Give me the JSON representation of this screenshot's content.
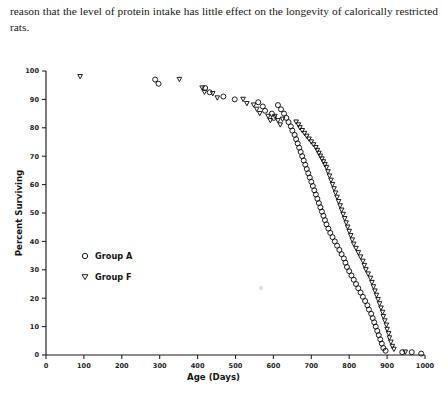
{
  "page": {
    "body_text": "reason that the level of protein intake has little effect on the longevity of calorically restricted rats."
  },
  "figure": {
    "legend": [
      {
        "marker": "circle-open",
        "label": "Group A",
        "marker_icon_name": "open-circle-marker-icon"
      },
      {
        "marker": "triangle-down-open",
        "label": "Group F",
        "marker_icon_name": "open-triangle-down-marker-icon"
      }
    ]
  },
  "chart_data": {
    "type": "scatter",
    "title": "",
    "xlabel": "Age (Days)",
    "ylabel": "Percent Surviving",
    "xlim": [
      0,
      1000
    ],
    "ylim": [
      0,
      100
    ],
    "xticks": [
      0,
      100,
      200,
      300,
      400,
      500,
      600,
      700,
      800,
      900,
      1000
    ],
    "xticklabels": [
      "0",
      "100",
      "200",
      "300",
      "400",
      "500",
      "600",
      "700",
      "800",
      "900",
      "1000"
    ],
    "yticks": [
      0,
      10,
      20,
      30,
      40,
      50,
      60,
      70,
      80,
      90,
      100
    ],
    "yticklabels": [
      "0",
      "10",
      "20",
      "30",
      "40",
      "50",
      "60",
      "70",
      "80",
      "90",
      "100"
    ],
    "grid": false,
    "legend_position": "inside-lower-left",
    "marker_style": "open",
    "series": [
      {
        "name": "Group A",
        "marker": "circle-open",
        "points": [
          [
            288,
            97
          ],
          [
            297,
            95.5
          ],
          [
            420,
            94
          ],
          [
            432,
            92.5
          ],
          [
            468,
            91
          ],
          [
            498,
            90
          ],
          [
            560,
            89
          ],
          [
            572,
            87.5
          ],
          [
            578,
            86
          ],
          [
            596,
            85
          ],
          [
            601,
            83.5
          ],
          [
            612,
            88
          ],
          [
            620,
            86.5
          ],
          [
            628,
            85
          ],
          [
            634,
            83.5
          ],
          [
            640,
            82
          ],
          [
            646,
            80.5
          ],
          [
            650,
            79
          ],
          [
            656,
            77.5
          ],
          [
            660,
            76
          ],
          [
            664,
            74.5
          ],
          [
            668,
            73
          ],
          [
            672,
            71.5
          ],
          [
            676,
            70
          ],
          [
            680,
            68.5
          ],
          [
            684,
            67
          ],
          [
            688,
            65.5
          ],
          [
            692,
            64
          ],
          [
            696,
            62.5
          ],
          [
            700,
            61
          ],
          [
            704,
            59.5
          ],
          [
            708,
            58
          ],
          [
            712,
            56.5
          ],
          [
            716,
            55
          ],
          [
            720,
            53.5
          ],
          [
            724,
            52
          ],
          [
            728,
            50.5
          ],
          [
            732,
            49
          ],
          [
            736,
            47.5
          ],
          [
            740,
            46
          ],
          [
            745,
            44.5
          ],
          [
            750,
            43
          ],
          [
            756,
            41.5
          ],
          [
            762,
            40
          ],
          [
            768,
            38.5
          ],
          [
            774,
            37
          ],
          [
            780,
            35.5
          ],
          [
            786,
            34
          ],
          [
            790,
            32.5
          ],
          [
            794,
            31
          ],
          [
            800,
            29.5
          ],
          [
            806,
            28
          ],
          [
            812,
            26.5
          ],
          [
            818,
            25
          ],
          [
            824,
            23.5
          ],
          [
            830,
            22
          ],
          [
            836,
            20.5
          ],
          [
            842,
            19
          ],
          [
            848,
            17.5
          ],
          [
            852,
            16
          ],
          [
            858,
            14.5
          ],
          [
            862,
            13
          ],
          [
            866,
            11.5
          ],
          [
            870,
            10
          ],
          [
            874,
            8.5
          ],
          [
            878,
            7
          ],
          [
            882,
            5.5
          ],
          [
            886,
            4
          ],
          [
            890,
            2.5
          ],
          [
            896,
            1.5
          ],
          [
            940,
            1
          ],
          [
            965,
            1
          ],
          [
            990,
            0.5
          ]
        ]
      },
      {
        "name": "Group F",
        "marker": "triangle-down-open",
        "points": [
          [
            90,
            98
          ],
          [
            352,
            97
          ],
          [
            412,
            94
          ],
          [
            418,
            92.5
          ],
          [
            440,
            92
          ],
          [
            452,
            90.5
          ],
          [
            520,
            90
          ],
          [
            530,
            88.5
          ],
          [
            548,
            88
          ],
          [
            556,
            86.5
          ],
          [
            564,
            85
          ],
          [
            586,
            84
          ],
          [
            592,
            82.5
          ],
          [
            604,
            84
          ],
          [
            612,
            82.5
          ],
          [
            618,
            81
          ],
          [
            624,
            83
          ],
          [
            660,
            82
          ],
          [
            666,
            81
          ],
          [
            670,
            80
          ],
          [
            676,
            79
          ],
          [
            682,
            78
          ],
          [
            688,
            77
          ],
          [
            694,
            76
          ],
          [
            700,
            75
          ],
          [
            706,
            74
          ],
          [
            712,
            73
          ],
          [
            716,
            72
          ],
          [
            720,
            71
          ],
          [
            724,
            70
          ],
          [
            728,
            69
          ],
          [
            732,
            68
          ],
          [
            736,
            67
          ],
          [
            740,
            66
          ],
          [
            744,
            64.5
          ],
          [
            748,
            63
          ],
          [
            752,
            61.5
          ],
          [
            756,
            60
          ],
          [
            760,
            58.5
          ],
          [
            764,
            57
          ],
          [
            768,
            55.5
          ],
          [
            772,
            54
          ],
          [
            776,
            52.5
          ],
          [
            780,
            51
          ],
          [
            784,
            49.5
          ],
          [
            788,
            48
          ],
          [
            792,
            46.5
          ],
          [
            796,
            45
          ],
          [
            800,
            43.5
          ],
          [
            804,
            42
          ],
          [
            808,
            40.5
          ],
          [
            812,
            39
          ],
          [
            818,
            37.5
          ],
          [
            824,
            36
          ],
          [
            830,
            34.5
          ],
          [
            836,
            33
          ],
          [
            840,
            31.5
          ],
          [
            844,
            30
          ],
          [
            850,
            28.5
          ],
          [
            856,
            27
          ],
          [
            860,
            25.5
          ],
          [
            864,
            24
          ],
          [
            868,
            22.5
          ],
          [
            872,
            21
          ],
          [
            876,
            19.5
          ],
          [
            880,
            18
          ],
          [
            884,
            16.5
          ],
          [
            888,
            15
          ],
          [
            890,
            13.5
          ],
          [
            894,
            12
          ],
          [
            898,
            10.5
          ],
          [
            900,
            9
          ],
          [
            904,
            7.5
          ],
          [
            906,
            6
          ],
          [
            910,
            4.5
          ],
          [
            914,
            3
          ],
          [
            918,
            2
          ],
          [
            948,
            1
          ]
        ]
      }
    ]
  }
}
